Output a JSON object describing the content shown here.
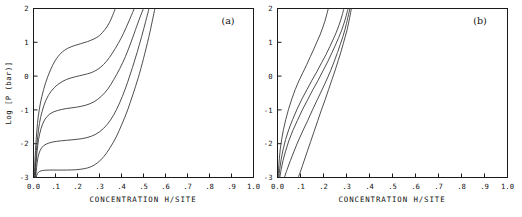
{
  "figure": {
    "background_color": "#ffffff",
    "axis_color": "#1a1a1a",
    "curve_color": "#3a3a3a"
  },
  "panels": [
    {
      "id": "a",
      "label": "(a)",
      "xlabel": "CONCENTRATION H/SITE",
      "ylabel": "Log [P (bar)]",
      "xticklabels": [
        "0.0",
        ".1",
        ".2",
        ".3",
        ".4",
        ".5",
        ".6",
        ".7",
        ".8",
        ".9",
        "1.0"
      ],
      "yticklabels": [
        "2",
        "1",
        "0",
        "-1",
        "-2",
        "-3"
      ]
    },
    {
      "id": "b",
      "label": "(b)",
      "xlabel": "CONCENTRATION H/SITE",
      "ylabel": "",
      "xticklabels": [
        "0.0",
        ".1",
        ".2",
        ".3",
        ".4",
        ".5",
        ".6",
        ".7",
        ".8",
        ".9",
        "1.0"
      ],
      "yticklabels": [
        "2",
        "1",
        "0",
        "-1",
        "-2",
        "-3"
      ]
    }
  ],
  "chart_data": [
    {
      "type": "line",
      "panel": "a",
      "title": "",
      "xlabel": "CONCENTRATION H/SITE",
      "ylabel": "Log [P (bar)]",
      "xlim": [
        0.0,
        1.0
      ],
      "ylim": [
        -3.0,
        2.0
      ],
      "xticks": [
        0.0,
        0.1,
        0.2,
        0.3,
        0.4,
        0.5,
        0.6,
        0.7,
        0.8,
        0.9,
        1.0
      ],
      "yticks": [
        -3,
        -2,
        -1,
        0,
        1,
        2
      ],
      "grid": false,
      "legend": null,
      "annotations": [
        {
          "text": "(a)",
          "x": 0.88,
          "y": 1.75
        }
      ],
      "series": [
        {
          "name": "curve-1",
          "x": [
            0.004,
            0.006,
            0.009,
            0.013,
            0.018,
            0.026,
            0.038,
            0.055,
            0.075,
            0.098,
            0.125,
            0.155,
            0.185,
            0.215,
            0.245,
            0.275,
            0.3,
            0.325,
            0.345,
            0.36,
            0.372
          ],
          "y": [
            -3.0,
            -2.6,
            -2.2,
            -1.8,
            -1.4,
            -1.0,
            -0.6,
            -0.2,
            0.15,
            0.45,
            0.68,
            0.82,
            0.9,
            0.96,
            1.02,
            1.1,
            1.2,
            1.38,
            1.58,
            1.8,
            2.0
          ]
        },
        {
          "name": "curve-2",
          "x": [
            0.006,
            0.009,
            0.013,
            0.019,
            0.027,
            0.039,
            0.056,
            0.08,
            0.112,
            0.15,
            0.19,
            0.228,
            0.262,
            0.292,
            0.318,
            0.345,
            0.372,
            0.398,
            0.42,
            0.44,
            0.458
          ],
          "y": [
            -3.0,
            -2.6,
            -2.2,
            -1.8,
            -1.4,
            -1.05,
            -0.72,
            -0.45,
            -0.24,
            -0.1,
            -0.02,
            0.04,
            0.1,
            0.2,
            0.34,
            0.55,
            0.82,
            1.12,
            1.42,
            1.72,
            2.0
          ]
        },
        {
          "name": "curve-3",
          "x": [
            0.008,
            0.011,
            0.016,
            0.023,
            0.034,
            0.05,
            0.074,
            0.108,
            0.15,
            0.195,
            0.238,
            0.275,
            0.308,
            0.338,
            0.365,
            0.392,
            0.418,
            0.442,
            0.464,
            0.484,
            0.5
          ],
          "y": [
            -3.0,
            -2.62,
            -2.24,
            -1.88,
            -1.56,
            -1.3,
            -1.12,
            -1.02,
            -0.96,
            -0.92,
            -0.86,
            -0.76,
            -0.6,
            -0.38,
            -0.1,
            0.22,
            0.58,
            0.98,
            1.38,
            1.74,
            2.0
          ]
        },
        {
          "name": "curve-4",
          "x": [
            0.01,
            0.014,
            0.02,
            0.03,
            0.046,
            0.07,
            0.105,
            0.15,
            0.198,
            0.243,
            0.283,
            0.318,
            0.35,
            0.378,
            0.404,
            0.428,
            0.45,
            0.472,
            0.492,
            0.51,
            0.525
          ],
          "y": [
            -3.0,
            -2.7,
            -2.42,
            -2.2,
            -2.06,
            -1.98,
            -1.93,
            -1.9,
            -1.87,
            -1.82,
            -1.72,
            -1.55,
            -1.3,
            -0.98,
            -0.6,
            -0.18,
            0.26,
            0.72,
            1.18,
            1.62,
            2.0
          ]
        },
        {
          "name": "curve-5",
          "x": [
            0.012,
            0.018,
            0.028,
            0.045,
            0.072,
            0.108,
            0.15,
            0.192,
            0.23,
            0.262,
            0.292,
            0.32,
            0.348,
            0.376,
            0.402,
            0.428,
            0.452,
            0.476,
            0.5,
            0.525,
            0.552
          ],
          "y": [
            -3.0,
            -2.88,
            -2.82,
            -2.79,
            -2.78,
            -2.78,
            -2.78,
            -2.77,
            -2.74,
            -2.68,
            -2.56,
            -2.38,
            -2.12,
            -1.8,
            -1.42,
            -1.0,
            -0.54,
            -0.05,
            0.52,
            1.18,
            2.0
          ]
        }
      ]
    },
    {
      "type": "line",
      "panel": "b",
      "title": "",
      "xlabel": "CONCENTRATION H/SITE",
      "ylabel": "",
      "xlim": [
        0.0,
        1.0
      ],
      "ylim": [
        -3.0,
        2.0
      ],
      "xticks": [
        0.0,
        0.1,
        0.2,
        0.3,
        0.4,
        0.5,
        0.6,
        0.7,
        0.8,
        0.9,
        1.0
      ],
      "yticks": [
        -3,
        -2,
        -1,
        0,
        1,
        2
      ],
      "grid": false,
      "legend": null,
      "annotations": [
        {
          "text": "(b)",
          "x": 0.88,
          "y": 1.75
        }
      ],
      "series": [
        {
          "name": "curve-1",
          "x": [
            0.003,
            0.005,
            0.008,
            0.012,
            0.018,
            0.026,
            0.036,
            0.048,
            0.062,
            0.077,
            0.093,
            0.11,
            0.127,
            0.143,
            0.158,
            0.172,
            0.185,
            0.196,
            0.206,
            0.214,
            0.221
          ],
          "y": [
            -3.0,
            -2.72,
            -2.44,
            -2.16,
            -1.88,
            -1.58,
            -1.28,
            -0.98,
            -0.68,
            -0.4,
            -0.14,
            0.1,
            0.34,
            0.58,
            0.8,
            1.02,
            1.22,
            1.42,
            1.62,
            1.82,
            2.0
          ]
        },
        {
          "name": "curve-2",
          "x": [
            0.006,
            0.01,
            0.016,
            0.024,
            0.035,
            0.049,
            0.066,
            0.085,
            0.106,
            0.128,
            0.15,
            0.172,
            0.192,
            0.211,
            0.228,
            0.243,
            0.256,
            0.267,
            0.276,
            0.283,
            0.289
          ],
          "y": [
            -3.0,
            -2.74,
            -2.46,
            -2.18,
            -1.88,
            -1.58,
            -1.28,
            -0.98,
            -0.68,
            -0.4,
            -0.12,
            0.14,
            0.4,
            0.64,
            0.88,
            1.1,
            1.3,
            1.5,
            1.68,
            1.85,
            2.0
          ]
        },
        {
          "name": "curve-3",
          "x": [
            0.01,
            0.016,
            0.024,
            0.035,
            0.049,
            0.066,
            0.086,
            0.108,
            0.131,
            0.154,
            0.177,
            0.198,
            0.218,
            0.236,
            0.252,
            0.266,
            0.278,
            0.288,
            0.296,
            0.302,
            0.307
          ],
          "y": [
            -3.0,
            -2.76,
            -2.5,
            -2.22,
            -1.92,
            -1.62,
            -1.32,
            -1.0,
            -0.7,
            -0.4,
            -0.12,
            0.16,
            0.42,
            0.68,
            0.92,
            1.14,
            1.34,
            1.54,
            1.72,
            1.87,
            2.0
          ]
        },
        {
          "name": "curve-4",
          "x": [
            0.03,
            0.042,
            0.056,
            0.072,
            0.09,
            0.11,
            0.131,
            0.152,
            0.173,
            0.194,
            0.213,
            0.231,
            0.247,
            0.261,
            0.273,
            0.284,
            0.293,
            0.3,
            0.306,
            0.311,
            0.315
          ],
          "y": [
            -3.0,
            -2.76,
            -2.5,
            -2.22,
            -1.92,
            -1.62,
            -1.32,
            -1.0,
            -0.7,
            -0.4,
            -0.12,
            0.16,
            0.44,
            0.7,
            0.94,
            1.16,
            1.37,
            1.56,
            1.74,
            1.88,
            2.0
          ]
        },
        {
          "name": "curve-5",
          "x": [
            0.09,
            0.102,
            0.115,
            0.129,
            0.144,
            0.159,
            0.175,
            0.191,
            0.207,
            0.222,
            0.237,
            0.251,
            0.264,
            0.276,
            0.286,
            0.295,
            0.303,
            0.309,
            0.314,
            0.318,
            0.321
          ],
          "y": [
            -3.0,
            -2.78,
            -2.52,
            -2.24,
            -1.94,
            -1.64,
            -1.32,
            -1.0,
            -0.7,
            -0.4,
            -0.1,
            0.18,
            0.46,
            0.72,
            0.96,
            1.18,
            1.38,
            1.57,
            1.74,
            1.88,
            2.0
          ]
        }
      ]
    }
  ]
}
